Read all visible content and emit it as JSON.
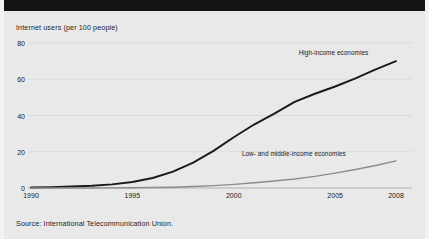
{
  "figure": {
    "background_color": "#e9e9e9",
    "top_band_color": "#141414",
    "title": "Internet users (per 100 people)",
    "source": "Source: International Telecommunication Union."
  },
  "chart_data": {
    "type": "line",
    "title": "Internet users (per 100 people)",
    "xlabel": "",
    "ylabel": "Internet users (per 100 people)",
    "xlim": [
      1990,
      2008
    ],
    "ylim": [
      0,
      80
    ],
    "yticks": [
      0,
      20,
      40,
      60,
      80
    ],
    "ytick_labels": [
      "0",
      "20",
      "40",
      "60",
      "80"
    ],
    "xticks": [
      1990,
      1995,
      2000,
      2005,
      2008
    ],
    "xtick_labels": [
      "1990",
      "1995",
      "2000",
      "2005",
      "2008"
    ],
    "grid": true,
    "grid_axis": "y",
    "legend_position": "inline-annotation",
    "x": [
      1990,
      1991,
      1992,
      1993,
      1994,
      1995,
      1996,
      1997,
      1998,
      1999,
      2000,
      2001,
      2002,
      2003,
      2004,
      2005,
      2006,
      2007,
      2008
    ],
    "series": [
      {
        "name": "High-income economies",
        "color": "#1a1a1a",
        "label_x": 2003.2,
        "label_y": 74.5,
        "values": [
          0.3,
          0.5,
          0.8,
          1.2,
          2.0,
          3.3,
          5.5,
          9.0,
          14.0,
          20.5,
          28.0,
          35.0,
          41.0,
          47.5,
          52.0,
          56.0,
          60.5,
          65.5,
          70.0
        ]
      },
      {
        "name": "Low- and middle-income economies",
        "color": "#8c8c8c",
        "label_x": 2000.4,
        "label_y": 18.5,
        "values": [
          0.0,
          0.0,
          0.02,
          0.04,
          0.07,
          0.12,
          0.25,
          0.45,
          0.8,
          1.3,
          2.0,
          2.9,
          3.9,
          5.0,
          6.4,
          8.2,
          10.2,
          12.4,
          15.0
        ]
      }
    ]
  }
}
